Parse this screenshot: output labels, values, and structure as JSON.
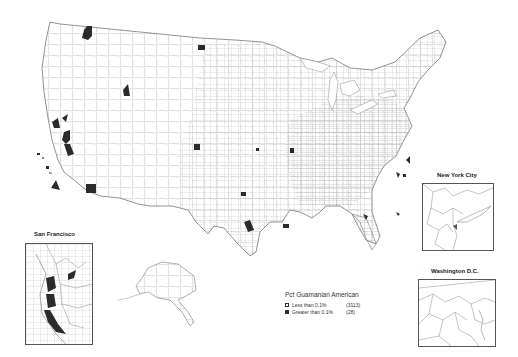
{
  "map": {
    "title": "Pct Guamanian American",
    "subject": "Percent Guamanian American by county, United States",
    "fill_colors": {
      "low": "#ffffff",
      "high": "#2b2b2b",
      "border": "#8a8a8a"
    }
  },
  "legend": {
    "title": "Pct Guamanian American",
    "items": [
      {
        "label": "Less than 0.1%",
        "count": "(3113)",
        "color": "#ffffff"
      },
      {
        "label": "Greater than 0.1%",
        "count": "(28)",
        "color": "#2b2b2b"
      }
    ]
  },
  "insets": {
    "san_francisco": {
      "title": "San  Francisco"
    },
    "new_york": {
      "title": "New York City"
    },
    "washington": {
      "title": "Washington D.C."
    }
  }
}
